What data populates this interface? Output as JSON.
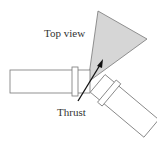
{
  "diagram": {
    "labels": {
      "top_view": "Top view",
      "thrust": "Thrust"
    },
    "colors": {
      "background": "#ffffff",
      "outline": "#777777",
      "plume_fill": "#d6d6d6",
      "arrow": "#111111",
      "text": "#333333"
    },
    "elements": [
      {
        "name": "left-nozzle-cylinder",
        "description": "horizontal cylinder with collar"
      },
      {
        "name": "right-nozzle-cylinder",
        "description": "cylinder angled down-right with collar"
      },
      {
        "name": "exhaust-plume",
        "description": "grey triangular plume"
      },
      {
        "name": "thrust-arrow",
        "description": "resultant thrust vector"
      }
    ]
  }
}
